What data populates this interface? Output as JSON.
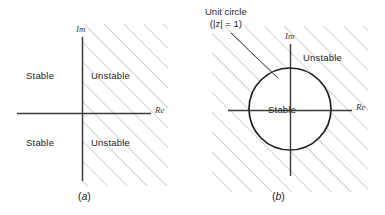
{
  "figure": {
    "name": "stability-regions-s-plane-and-z-plane",
    "background": "#ffffff",
    "ink_color": "#2b2b2b",
    "hatch_color": "#9a9a9a",
    "width": 385,
    "height": 215
  },
  "panel_a": {
    "caption": "(a)",
    "caption_paren_open": "(",
    "caption_letter": "a",
    "caption_paren_close": ")",
    "axis_imaginary": "Im",
    "axis_real": "Re",
    "regions": [
      {
        "label": "Stable",
        "quadrant": "upper-left"
      },
      {
        "label": "Unstable",
        "quadrant": "upper-right"
      },
      {
        "label": "Stable",
        "quadrant": "lower-left"
      },
      {
        "label": "Unstable",
        "quadrant": "lower-right"
      }
    ],
    "stable_label_top": "Stable",
    "unstable_label_top": "Unstable",
    "stable_label_bottom": "Stable",
    "unstable_label_bottom": "Unstable",
    "hatched_side": "right half plane"
  },
  "panel_b": {
    "caption": "(b)",
    "caption_paren_open": "(",
    "caption_letter": "b",
    "caption_paren_close": ")",
    "axis_imaginary": "Im",
    "axis_real": "Re",
    "callout_line1": "Unit circle",
    "callout_line2": "(|z| = 1)",
    "stable_label": "Stable",
    "unstable_label": "Unstable",
    "circle": {
      "center_x": 290,
      "center_y": 109,
      "radius": 41
    },
    "hatched_side": "outside unit circle"
  }
}
